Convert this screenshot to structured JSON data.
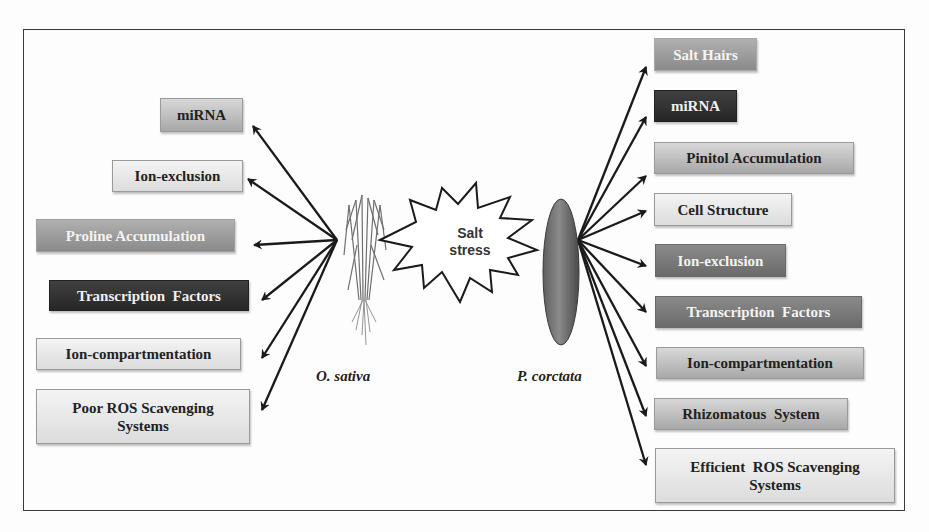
{
  "center": {
    "stress_label_line1": "Salt",
    "stress_label_line2": "stress"
  },
  "left_species": {
    "name": "O. sativa",
    "icon": "rice-plant-icon",
    "traits": [
      {
        "label": "miRNA",
        "shade": "mid"
      },
      {
        "label": "Ion-exclusion",
        "shade": "light"
      },
      {
        "label": "Proline Accumulation",
        "shade": "grey"
      },
      {
        "label": "Transcription  Factors",
        "shade": "dark"
      },
      {
        "label": "Ion-compartmentation",
        "shade": "light"
      },
      {
        "label_line1": "Poor ROS Scavenging",
        "label_line2": "Systems",
        "shade": "light"
      }
    ]
  },
  "right_species": {
    "name": "P. corctata",
    "icon": "propagule-icon",
    "traits": [
      {
        "label": "Salt Hairs",
        "shade": "grey"
      },
      {
        "label": "miRNA",
        "shade": "dark"
      },
      {
        "label": "Pinitol Accumulation",
        "shade": "mid"
      },
      {
        "label": "Cell Structure",
        "shade": "light"
      },
      {
        "label": "Ion-exclusion",
        "shade": "dgrey"
      },
      {
        "label": "Transcription  Factors",
        "shade": "dgrey"
      },
      {
        "label": "Ion-compartmentation",
        "shade": "mid"
      },
      {
        "label": "Rhizomatous  System",
        "shade": "mid"
      },
      {
        "label_line1": "Efficient  ROS Scavenging",
        "label_line2": "Systems",
        "shade": "light"
      }
    ]
  },
  "colors": {
    "frame": "#3a3a3a",
    "arrow": "#1a1a1a",
    "dark_box": "#2e2e2e",
    "grey_box": "#9a9a9a",
    "light_box": "#e6e6e6"
  }
}
